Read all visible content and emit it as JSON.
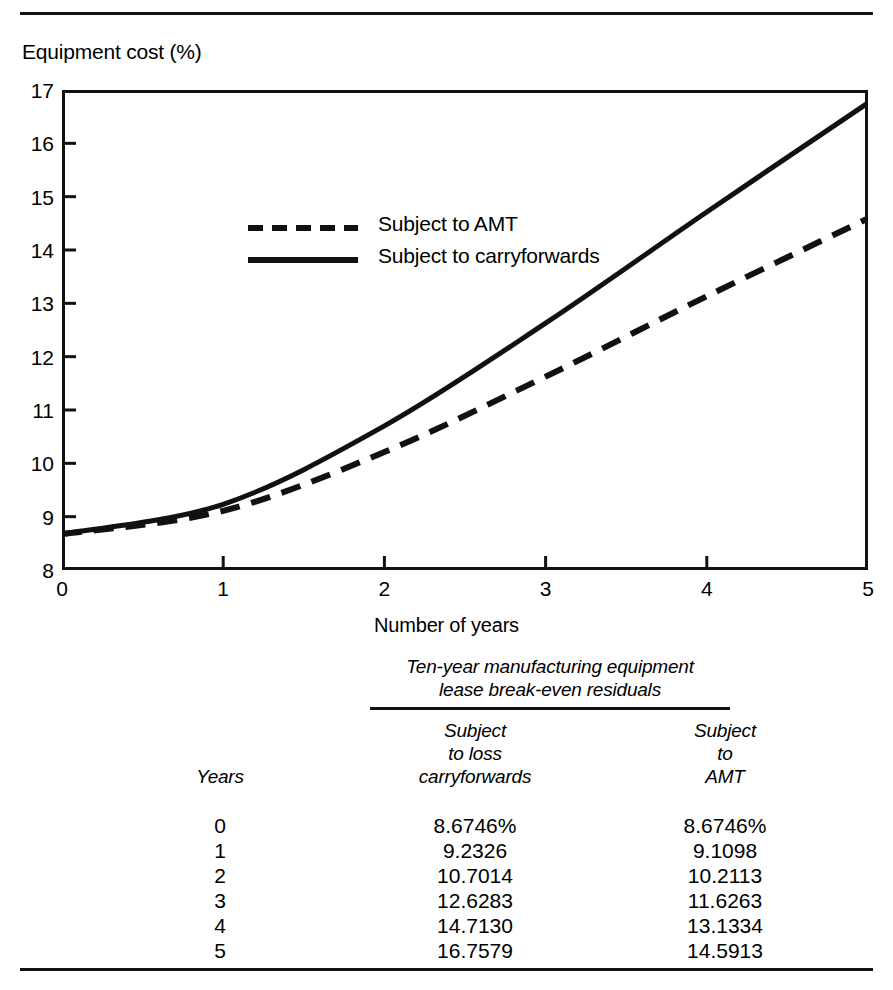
{
  "chart_data": {
    "type": "line",
    "title": "",
    "xlabel": "Number of years",
    "ylabel": "Equipment cost (%)",
    "x": [
      0,
      1,
      2,
      3,
      4,
      5
    ],
    "xlim": [
      0,
      5
    ],
    "ylim": [
      8,
      17
    ],
    "xticks": [
      "0",
      "1",
      "2",
      "3",
      "4",
      "5"
    ],
    "yticks": [
      "8",
      "9",
      "10",
      "11",
      "12",
      "13",
      "14",
      "15",
      "16",
      "17"
    ],
    "grid": false,
    "legend_position": "upper-left-inside",
    "series": [
      {
        "name": "Subject to carryforwards",
        "style": "solid",
        "values": [
          8.6746,
          9.2326,
          10.7014,
          12.6283,
          14.713,
          16.7579
        ]
      },
      {
        "name": "Subject to AMT",
        "style": "dashed",
        "values": [
          8.6746,
          9.1098,
          10.2113,
          11.6263,
          13.1334,
          14.5913
        ]
      }
    ]
  },
  "axes": {
    "y_title": "Equipment cost (%)",
    "x_title": "Number of years",
    "y_tick_labels": [
      "17",
      "16",
      "15",
      "14",
      "13",
      "12",
      "11",
      "10",
      "9",
      "8"
    ],
    "x_tick_labels": [
      "0",
      "1",
      "2",
      "3",
      "4",
      "5"
    ]
  },
  "legend": {
    "entries": [
      {
        "label": "Subject to AMT",
        "style": "dashed"
      },
      {
        "label": "Subject to carryforwards",
        "style": "solid"
      }
    ]
  },
  "table": {
    "title_line1": "Ten-year manufacturing equipment",
    "title_line2": "lease break-even residuals",
    "headers": {
      "years": "Years",
      "carryforwards": "Subject\nto loss\ncarryforwards",
      "amt": "Subject\nto\nAMT"
    },
    "rows": [
      {
        "year": "0",
        "carryforwards": "8.6746%",
        "amt": "8.6746%"
      },
      {
        "year": "1",
        "carryforwards": "9.2326",
        "amt": "9.1098"
      },
      {
        "year": "2",
        "carryforwards": "10.7014",
        "amt": "10.2113"
      },
      {
        "year": "3",
        "carryforwards": "12.6283",
        "amt": "11.6263"
      },
      {
        "year": "4",
        "carryforwards": "14.7130",
        "amt": "13.1334"
      },
      {
        "year": "5",
        "carryforwards": "16.7579",
        "amt": "14.5913"
      }
    ]
  },
  "colors": {
    "ink": "#111111",
    "background": "#ffffff"
  }
}
